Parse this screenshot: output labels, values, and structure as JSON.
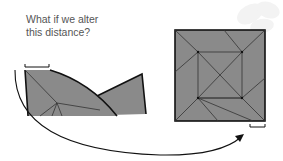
{
  "caption": {
    "line1": "What if we alter",
    "line2": "this distance?"
  },
  "colors": {
    "paper_fill": "#8a8a8a",
    "stroke": "#111111",
    "crease": "#3a3a3a",
    "text": "#555555",
    "watermark": "#f2f2f2"
  },
  "diagram": {
    "left_shape": "folded-partial-base",
    "right_shape": "square-crease-pattern",
    "arrow": "curved-arrow-left-to-right"
  }
}
